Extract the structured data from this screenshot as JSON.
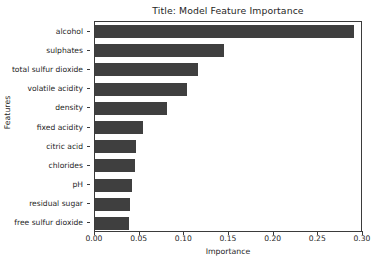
{
  "chart_data": {
    "type": "bar",
    "orientation": "horizontal",
    "title": "Title: Model Feature Importance",
    "xlabel": "Importance",
    "ylabel": "Features",
    "categories": [
      "alcohol",
      "sulphates",
      "total sulfur dioxide",
      "volatile acidity",
      "density",
      "fixed acidity",
      "citric acid",
      "chlorides",
      "pH",
      "residual sugar",
      "free sulfur dioxide"
    ],
    "values": [
      0.29,
      0.144,
      0.115,
      0.103,
      0.081,
      0.054,
      0.046,
      0.045,
      0.041,
      0.039,
      0.038
    ],
    "xlim": [
      0.0,
      0.3
    ],
    "xticks": [
      0.0,
      0.05,
      0.1,
      0.15,
      0.2,
      0.25,
      0.3
    ],
    "xtick_labels": [
      "0.00",
      "0.05",
      "0.10",
      "0.15",
      "0.20",
      "0.25",
      "0.30"
    ],
    "grid": false,
    "legend": null,
    "bar_color": "#3f3f3f",
    "frame_color": "#3b3b3b",
    "background": "#ffffff"
  }
}
